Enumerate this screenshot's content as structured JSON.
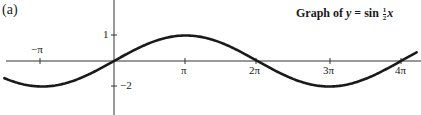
{
  "panel_label": "(a)",
  "title": {
    "prefix": "Graph of ",
    "var_y": "y",
    "equals": " = sin ",
    "frac_num": "1",
    "frac_den": "2",
    "var_x": "x"
  },
  "colors": {
    "ink": "#1a1a1a",
    "background": "#ffffff"
  },
  "axis_labels": {
    "x_ticks": [
      "−π",
      "π",
      "2π",
      "3π",
      "4π"
    ],
    "y_ticks": [
      "1",
      "−2"
    ]
  },
  "chart_data": {
    "type": "line",
    "xlabel": "",
    "ylabel": "",
    "function": "y = sin(x/2)",
    "x_tick_labels": [
      "−π",
      "π",
      "2π",
      "3π",
      "4π"
    ],
    "x_tick_values": [
      -3.14159,
      3.14159,
      6.28319,
      9.42478,
      12.56637
    ],
    "y_tick_labels": [
      "1",
      "−2"
    ],
    "y_tick_values": [
      1,
      -1
    ],
    "xlim": [
      -5.0,
      13.3
    ],
    "ylim": [
      -1.1,
      1.1
    ],
    "grid": false,
    "legend": null,
    "series": [
      {
        "name": "y = sin(x/2)",
        "x": [
          -4.71,
          -3.14159,
          -1.5708,
          0,
          1.5708,
          3.14159,
          4.7124,
          6.28319,
          7.854,
          9.42478,
          10.9956,
          12.56637,
          13.3
        ],
        "y": [
          -0.71,
          -1.0,
          -0.71,
          0,
          0.71,
          1.0,
          0.71,
          0,
          -0.71,
          -1.0,
          -0.71,
          0,
          0.36
        ]
      }
    ]
  }
}
